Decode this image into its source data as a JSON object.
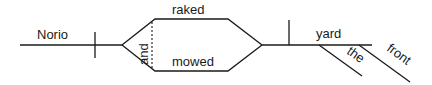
{
  "diagram": {
    "type": "sentence-diagram",
    "subject": "Norio",
    "predicates": [
      "raked",
      "mowed"
    ],
    "conjunction": "and",
    "direct_object": "yard",
    "modifiers": [
      "the",
      "front"
    ]
  }
}
